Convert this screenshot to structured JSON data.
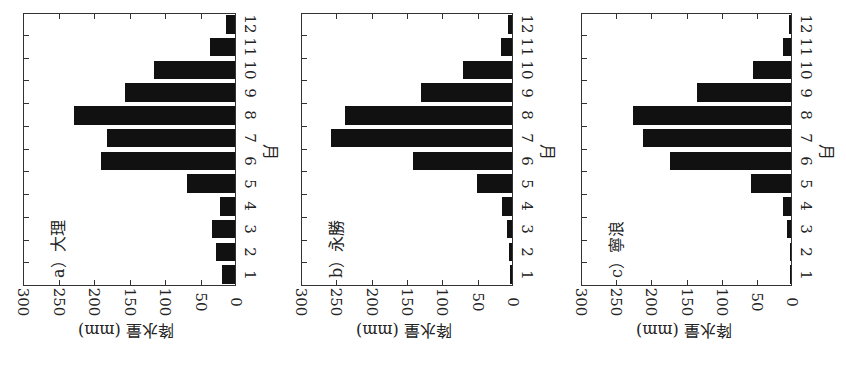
{
  "chart_data": [
    {
      "type": "bar",
      "orientation": "horizontal (figure rotated 90°; months run bottom-to-top, values increase leftward)",
      "title": "a) 大理",
      "station": "大理",
      "panel_label": "a）",
      "xlabel": "月",
      "ylabel": "降水量 (mm)",
      "ylim": [
        0,
        300
      ],
      "yticks": [
        0,
        50,
        100,
        150,
        200,
        250,
        300
      ],
      "categories": [
        "1",
        "2",
        "3",
        "4",
        "5",
        "6",
        "7",
        "8",
        "9",
        "10",
        "11",
        "12"
      ],
      "values": [
        18,
        27,
        32,
        21,
        67,
        189,
        180,
        227,
        155,
        114,
        35,
        13
      ],
      "grid": false,
      "legend": null
    },
    {
      "type": "bar",
      "orientation": "horizontal (figure rotated 90°; months run bottom-to-top, values increase leftward)",
      "title": "b) 永勝",
      "station": "永勝",
      "panel_label": "b）",
      "xlabel": "月",
      "ylabel": "降水量 (mm)",
      "ylim": [
        0,
        300
      ],
      "yticks": [
        0,
        50,
        100,
        150,
        200,
        250,
        300
      ],
      "categories": [
        "1",
        "2",
        "3",
        "4",
        "5",
        "6",
        "7",
        "8",
        "9",
        "10",
        "11",
        "12"
      ],
      "values": [
        3,
        4,
        7,
        14,
        49,
        140,
        256,
        236,
        129,
        69,
        16,
        5
      ],
      "grid": false,
      "legend": null
    },
    {
      "type": "bar",
      "orientation": "horizontal (figure rotated 90°; months run bottom-to-top, values increase leftward)",
      "title": "c) 寧浪",
      "station": "寧浪",
      "panel_label": "c）",
      "xlabel": "月",
      "ylabel": "降水量 (mm)",
      "ylim": [
        0,
        300
      ],
      "yticks": [
        0,
        50,
        100,
        150,
        200,
        250,
        300
      ],
      "categories": [
        "1",
        "2",
        "3",
        "4",
        "5",
        "6",
        "7",
        "8",
        "9",
        "10",
        "11",
        "12"
      ],
      "values": [
        1,
        2,
        6,
        11,
        57,
        172,
        210,
        225,
        134,
        54,
        11,
        3
      ],
      "grid": false,
      "legend": null
    }
  ],
  "panels": [
    {
      "label": "a）大理",
      "y_title": "降水量 (mm)",
      "x_title": "月"
    },
    {
      "label": "b）永勝",
      "y_title": "降水量 (mm)",
      "x_title": "月"
    },
    {
      "label": "c）寧浪",
      "y_title": "降水量 (mm)",
      "x_title": "月"
    }
  ],
  "colors": {
    "bar": "#111111",
    "frame": "#333333",
    "background": "#ffffff"
  }
}
